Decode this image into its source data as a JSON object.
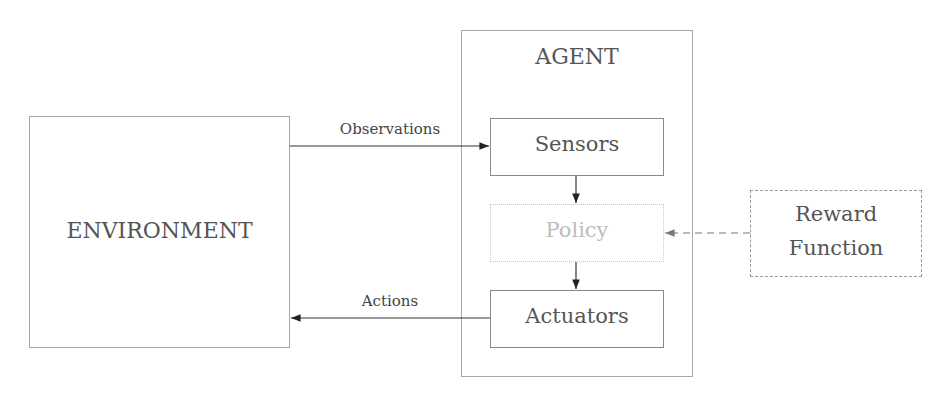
{
  "diagram": {
    "environment": {
      "label": "ENVIRONMENT"
    },
    "agent": {
      "title": "AGENT",
      "sensors": "Sensors",
      "policy": "Policy",
      "actuators": "Actuators"
    },
    "reward": {
      "line1": "Reward",
      "line2": "Function"
    },
    "edges": {
      "observations": "Observations",
      "actions": "Actions"
    },
    "colors": {
      "box_border": "#9a9a9a",
      "text": "#555555",
      "policy_text": "#bdbdbd",
      "arrow": "#222222",
      "reward_arrow": "#777777"
    }
  }
}
